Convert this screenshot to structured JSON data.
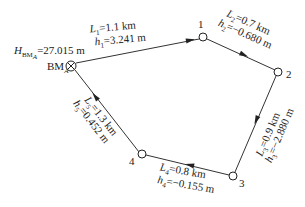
{
  "diagram": {
    "type": "closed leveling route",
    "benchmark": {
      "name": "BM",
      "subscript": "A",
      "elevation_label": "H",
      "elevation_subscript": "BM_A",
      "elevation_value": "=27.015 m"
    },
    "points": [
      {
        "id": "BM",
        "label": "BM"
      },
      {
        "id": "1",
        "label": "1"
      },
      {
        "id": "2",
        "label": "2"
      },
      {
        "id": "3",
        "label": "3"
      },
      {
        "id": "4",
        "label": "4"
      }
    ],
    "segments": [
      {
        "from": "BM",
        "to": "1",
        "L_sub": "1",
        "L": "=1.1 km",
        "h_sub": "1",
        "h": "=3.241 m"
      },
      {
        "from": "1",
        "to": "2",
        "L_sub": "2",
        "L": "=0.7 km",
        "h_sub": "2",
        "h": "=−0.680 m"
      },
      {
        "from": "2",
        "to": "3",
        "L_sub": "3",
        "L": "=0.9 km",
        "h_sub": "3",
        "h": "=−2.880 m"
      },
      {
        "from": "3",
        "to": "4",
        "L_sub": "4",
        "L": "=0.8 km",
        "h_sub": "4",
        "h": "=−0.155 m"
      },
      {
        "from": "4",
        "to": "BM",
        "L_sub": "5",
        "L": "=1.3 km",
        "h_sub": "5",
        "h": "=0.452 m"
      }
    ],
    "colors": {
      "line": "#333333",
      "text": "#222222",
      "background": "#ffffff"
    }
  }
}
